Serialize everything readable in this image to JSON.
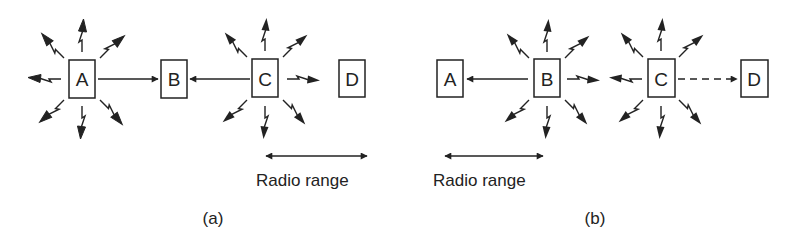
{
  "figure": {
    "panels": [
      {
        "id": "a",
        "caption": "(a)",
        "nodes": [
          {
            "label": "A",
            "transmitting": true
          },
          {
            "label": "B",
            "transmitting": false
          },
          {
            "label": "C",
            "transmitting": true
          },
          {
            "label": "D",
            "transmitting": false
          }
        ],
        "links": [
          {
            "from": "A",
            "to": "B",
            "style": "solid"
          },
          {
            "from": "C",
            "to": "B",
            "style": "solid"
          }
        ],
        "range_label": "Radio range"
      },
      {
        "id": "b",
        "caption": "(b)",
        "nodes": [
          {
            "label": "A",
            "transmitting": false
          },
          {
            "label": "B",
            "transmitting": true
          },
          {
            "label": "C",
            "transmitting": true
          },
          {
            "label": "D",
            "transmitting": false
          }
        ],
        "links": [
          {
            "from": "B",
            "to": "A",
            "style": "solid"
          },
          {
            "from": "C",
            "to": "D",
            "style": "dashed"
          }
        ],
        "range_label": "Radio range"
      }
    ],
    "colors": {
      "stroke": "#222222",
      "background": "#ffffff"
    }
  }
}
